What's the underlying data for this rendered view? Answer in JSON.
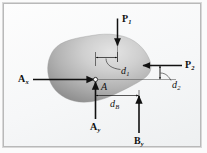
{
  "figure": {
    "background_color": "#f6f7f8",
    "frame_color": "#b9b9b9",
    "body_fill_dark": "#8f8f8f",
    "body_fill_light": "#d8d8d8",
    "line_color": "#111111"
  },
  "labels": {
    "p1": {
      "base": "P",
      "sub": "1"
    },
    "p2": {
      "base": "P",
      "sub": "2"
    },
    "ax": {
      "base": "A",
      "sub": "x"
    },
    "ay": {
      "base": "A",
      "sub": "y"
    },
    "by": {
      "base": "B",
      "sub": "y"
    },
    "point_a": {
      "base": "A",
      "sub": ""
    },
    "d1": {
      "base": "d",
      "sub": "1"
    },
    "d2": {
      "base": "d",
      "sub": "2"
    },
    "db": {
      "base": "d",
      "sub": "B"
    }
  },
  "forces": [
    {
      "name": "P1",
      "direction": "down",
      "label": "P₁"
    },
    {
      "name": "P2",
      "direction": "left",
      "label": "P₂"
    },
    {
      "name": "Ax",
      "direction": "right",
      "label": "Aₓ"
    },
    {
      "name": "Ay",
      "direction": "up",
      "label": "A_y"
    },
    {
      "name": "By",
      "direction": "up",
      "label": "B_y"
    }
  ],
  "dimensions": [
    {
      "name": "d1",
      "label": "d₁",
      "from": "A",
      "to": "P1 line of action",
      "orientation": "horizontal"
    },
    {
      "name": "d2",
      "label": "d₂",
      "from": "A axis",
      "to": "P2 line of action",
      "orientation": "vertical"
    },
    {
      "name": "dB",
      "label": "d_B",
      "from": "A",
      "to": "By line of action",
      "orientation": "horizontal"
    }
  ],
  "points": [
    {
      "name": "A",
      "label": "A",
      "type": "pin-support"
    }
  ]
}
